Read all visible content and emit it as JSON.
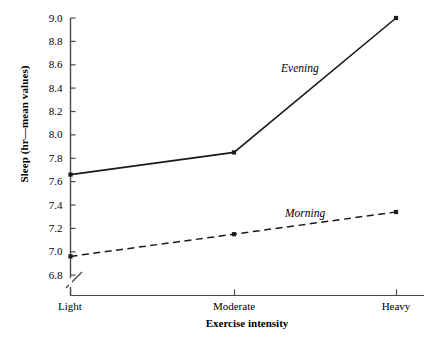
{
  "chart_data": {
    "type": "line",
    "title": "",
    "xlabel": "Exercise intensity",
    "ylabel": "Sleep (hr—mean values)",
    "categories": [
      "Light",
      "Moderate",
      "Heavy"
    ],
    "ylim": [
      6.8,
      9.0
    ],
    "ytick_step": 0.2,
    "ytick_labels": [
      "9.0",
      "8.8",
      "8.6",
      "8.4",
      "8.2",
      "8.0",
      "7.8",
      "7.6",
      "7.4",
      "7.2",
      "7.0",
      "6.8"
    ],
    "grid": false,
    "legend_position": "inline-annotation",
    "axis_break": true,
    "series": [
      {
        "name": "Evening",
        "style": "solid",
        "marker": "square",
        "color": "#1a1a1a",
        "values": [
          7.66,
          7.85,
          9.0
        ]
      },
      {
        "name": "Morning",
        "style": "dashed",
        "marker": "square",
        "color": "#1a1a1a",
        "values": [
          6.96,
          7.15,
          7.34
        ]
      }
    ],
    "annotations": [
      {
        "text": "Evening",
        "series": "Evening"
      },
      {
        "text": "Morning",
        "series": "Morning"
      }
    ]
  },
  "axes": {
    "y_title": "Sleep (hr—mean values)",
    "x_title": "Exercise intensity",
    "y_ticks": [
      {
        "label": "9.0",
        "y": 18
      },
      {
        "label": "8.8",
        "y": 41.4
      },
      {
        "label": "8.6",
        "y": 64.8
      },
      {
        "label": "8.4",
        "y": 88.1
      },
      {
        "label": "8.2",
        "y": 111.5
      },
      {
        "label": "8.0",
        "y": 134.9
      },
      {
        "label": "7.8",
        "y": 158.3
      },
      {
        "label": "7.6",
        "y": 181.6
      },
      {
        "label": "7.4",
        "y": 205.0
      },
      {
        "label": "7.2",
        "y": 228.4
      },
      {
        "label": "7.0",
        "y": 251.8
      },
      {
        "label": "6.8",
        "y": 275.1
      }
    ],
    "x_ticks": [
      {
        "label": "Light",
        "x": 70
      },
      {
        "label": "Moderate",
        "x": 234
      },
      {
        "label": "Heavy",
        "x": 396
      }
    ]
  },
  "colors": {
    "axis": "#4a4a4a",
    "line": "#1a1a1a",
    "text": "#000000",
    "background": "#ffffff"
  }
}
